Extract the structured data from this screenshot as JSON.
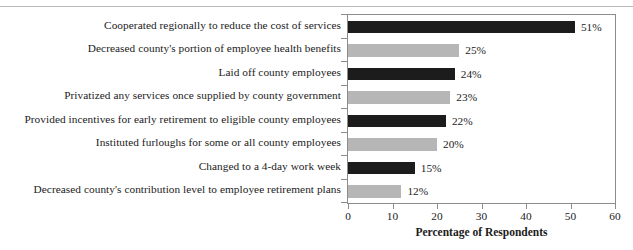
{
  "chart_data": {
    "type": "bar",
    "orientation": "horizontal",
    "title": "",
    "xlabel": "Percentage of Respondents",
    "ylabel": "",
    "xlim": [
      0,
      60
    ],
    "xticks": [
      0,
      10,
      20,
      30,
      40,
      50,
      60
    ],
    "grid": false,
    "legend": "none",
    "value_suffix": "%",
    "categories": [
      "Cooperated regionally to reduce the cost of services",
      "Decreased county's portion of employee health benefits",
      "Laid off county employees",
      "Privatized any services once supplied by county government",
      "Provided incentives for early retirement to eligible county employees",
      "Instituted furloughs for some or all county employees",
      "Changed to a 4-day work week",
      "Decreased county's contribution level to employee retirement plans"
    ],
    "values": [
      51,
      25,
      24,
      23,
      22,
      20,
      15,
      12
    ],
    "value_labels": [
      "51%",
      "25%",
      "24%",
      "23%",
      "22%",
      "20%",
      "15%",
      "12%"
    ],
    "bar_colors": [
      "#1c1c1c",
      "#b6b6b6",
      "#1c1c1c",
      "#b6b6b6",
      "#1c1c1c",
      "#b6b6b6",
      "#1c1c1c",
      "#b6b6b6"
    ],
    "colors": {
      "dark_bar": "#1c1c1c",
      "light_bar": "#b6b6b6",
      "axis": "#8c8c8c",
      "text": "#1b1b1b",
      "background": "#ffffff"
    }
  }
}
